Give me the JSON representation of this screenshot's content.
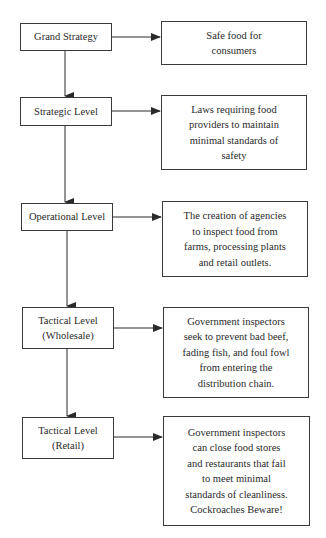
{
  "diagram": {
    "levels": [
      {
        "label": "Grand Strategy",
        "description": "Safe food for\nconsumers"
      },
      {
        "label": "Strategic Level",
        "description": "Laws requiring food\nproviders to maintain\nminimal standards of\nsafety"
      },
      {
        "label": "Operational Level",
        "description": "The creation of agencies\nto inspect food from\nfarms, processing plants\nand retail outlets."
      },
      {
        "label": "Tactical Level\n(Wholesale)",
        "description": "Government inspectors\nseek to prevent bad beef,\nfading fish, and foul fowl\nfrom entering the\ndistribution chain."
      },
      {
        "label": "Tactical Level\n(Retail)",
        "description": "Government inspectors\ncan close food stores\nand restaurants that fail\nto meet minimal\nstandards of cleanliness.\nCockroaches Beware!"
      }
    ],
    "colors": {
      "line": "#2a2a2a",
      "box_border": "#3a3a3a",
      "text": "#2a2a2a",
      "background": "#ffffff"
    }
  }
}
